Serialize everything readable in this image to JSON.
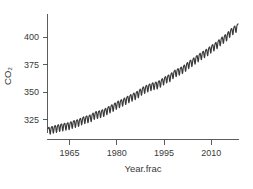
{
  "chart_data": {
    "type": "line",
    "title": "",
    "subtitle": "",
    "xlabel": "Year.frac",
    "ylabel": "CO2",
    "ylabel_display": "CO₂",
    "grid": false,
    "legend": "none",
    "xlim": [
      1958.0,
      2018.5
    ],
    "ylim": [
      313.0,
      421.0
    ],
    "xticks": [
      1965,
      1980,
      1995,
      2010
    ],
    "xtick_labels": [
      "1965",
      "1980",
      "1995",
      "2010"
    ],
    "yticks": [
      325,
      350,
      375,
      400
    ],
    "ytick_labels": [
      "325",
      "350",
      "375",
      "400"
    ],
    "series_name": "Atmospheric CO2 (Mauna Loa monthly mean)",
    "series_color": "#3a3a3a",
    "units": "ppm",
    "seasonal_amplitude_ppm": 3.2,
    "annual_means": {
      "x": [
        1958,
        1959,
        1960,
        1961,
        1962,
        1963,
        1964,
        1965,
        1966,
        1967,
        1968,
        1969,
        1970,
        1971,
        1972,
        1973,
        1974,
        1975,
        1976,
        1977,
        1978,
        1979,
        1980,
        1981,
        1982,
        1983,
        1984,
        1985,
        1986,
        1987,
        1988,
        1989,
        1990,
        1991,
        1992,
        1993,
        1994,
        1995,
        1996,
        1997,
        1998,
        1999,
        2000,
        2001,
        2002,
        2003,
        2004,
        2005,
        2006,
        2007,
        2008,
        2009,
        2010,
        2011,
        2012,
        2013,
        2014,
        2015,
        2016,
        2017,
        2018
      ],
      "y": [
        315.3,
        315.98,
        316.91,
        317.64,
        318.45,
        318.99,
        319.62,
        320.04,
        321.38,
        322.16,
        323.04,
        324.62,
        325.68,
        326.32,
        327.45,
        329.68,
        330.18,
        331.11,
        332.04,
        333.83,
        335.4,
        336.84,
        338.75,
        340.11,
        341.45,
        343.05,
        344.65,
        346.12,
        347.42,
        349.19,
        351.57,
        353.12,
        354.39,
        355.61,
        356.45,
        357.1,
        358.83,
        360.82,
        362.61,
        363.73,
        366.7,
        368.38,
        369.55,
        371.14,
        373.28,
        375.8,
        377.52,
        379.8,
        381.9,
        383.79,
        385.6,
        387.43,
        389.9,
        391.65,
        393.85,
        396.52,
        398.65,
        400.83,
        404.24,
        406.55,
        408.52
      ]
    }
  }
}
